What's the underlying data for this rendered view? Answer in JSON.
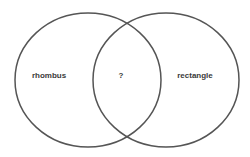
{
  "diagram": {
    "type": "venn",
    "stroke_color": "#555555",
    "circles": [
      {
        "name": "left",
        "label": "rhombus"
      },
      {
        "name": "right",
        "label": "rectangle"
      }
    ],
    "intersection_label": "?"
  }
}
